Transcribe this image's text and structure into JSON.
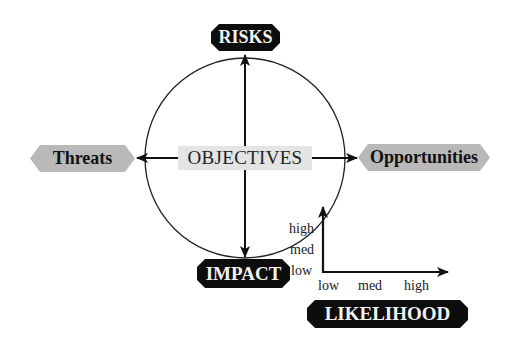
{
  "diagram": {
    "center_label": "OBJECTIVES",
    "nodes": {
      "top": "RISKS",
      "left": "Threats",
      "right": "Opportunities",
      "bottom": "IMPACT",
      "axis_x": "LIKELIHOOD"
    },
    "impact_scale": [
      "high",
      "med",
      "low"
    ],
    "likelihood_scale": [
      "low",
      "med",
      "high"
    ],
    "colors": {
      "dark_badge": "#0d0d0d",
      "grey_badge": "#b9b9b9",
      "objectives_bg": "#e4e4e4",
      "line": "#111111"
    }
  }
}
